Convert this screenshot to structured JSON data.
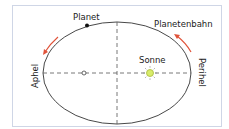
{
  "diagram": {
    "labels": {
      "planet": "Planet",
      "orbit": "Planetenbahn",
      "sun": "Sonne",
      "aphelion": "Aphel",
      "perihelion": "Perihel"
    },
    "colors": {
      "frame": "#cfd6e6",
      "orbit": "#333333",
      "arrow": "#e0533a",
      "sun_fill": "#d8ec6a",
      "sun_stroke": "#a8b83a"
    }
  }
}
